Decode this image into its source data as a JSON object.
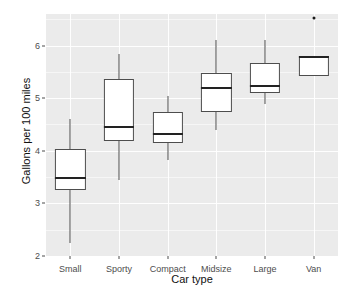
{
  "chart_data": {
    "type": "box",
    "title": "",
    "xlabel": "Car type",
    "ylabel": "Gallons per 100 miles",
    "categories": [
      "Small",
      "Sporty",
      "Compact",
      "Midsize",
      "Large",
      "Van"
    ],
    "ylim": [
      2.0,
      6.6
    ],
    "yticks": [
      2,
      3,
      4,
      5,
      6
    ],
    "ytick_labels": [
      "2",
      "3",
      "4",
      "5",
      "6"
    ],
    "grid": true,
    "grid_color": "#ffffff",
    "panel_color": "#ebebeb",
    "box_fill": "#ffffff",
    "box_line": "#4d4d4d",
    "median_color": "#222222",
    "legend": "none",
    "boxes": [
      {
        "category": "Small",
        "whisker_low": 2.25,
        "q1": 3.26,
        "median": 3.49,
        "q3": 4.04,
        "whisker_high": 4.61,
        "outliers": []
      },
      {
        "category": "Sporty",
        "whisker_low": 3.45,
        "q1": 4.19,
        "median": 4.46,
        "q3": 5.37,
        "whisker_high": 5.84,
        "outliers": []
      },
      {
        "category": "Compact",
        "whisker_low": 3.83,
        "q1": 4.15,
        "median": 4.31,
        "q3": 4.74,
        "whisker_high": 5.05,
        "outliers": []
      },
      {
        "category": "Midsize",
        "whisker_low": 4.4,
        "q1": 4.74,
        "median": 5.2,
        "q3": 5.47,
        "whisker_high": 6.11,
        "outliers": []
      },
      {
        "category": "Large",
        "whisker_low": 4.88,
        "q1": 5.09,
        "median": 5.24,
        "q3": 5.66,
        "whisker_high": 6.11,
        "outliers": []
      },
      {
        "category": "Van",
        "whisker_low": 5.43,
        "q1": 5.43,
        "median": 5.79,
        "q3": 5.81,
        "whisker_high": 5.81,
        "outliers": [
          6.53
        ]
      }
    ]
  }
}
